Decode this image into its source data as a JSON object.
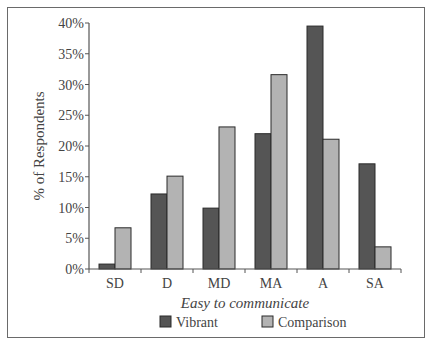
{
  "chart_data": {
    "type": "bar",
    "title": "",
    "xlabel": "Easy to communicate",
    "ylabel": "% of Respondents",
    "categories": [
      "SD",
      "D",
      "MD",
      "MA",
      "A",
      "SA"
    ],
    "series": [
      {
        "name": "Vibrant",
        "color": "#555555",
        "values": [
          0.8,
          12.2,
          9.9,
          22.0,
          39.5,
          17.1
        ]
      },
      {
        "name": "Comparison",
        "color": "#b3b3b3",
        "values": [
          6.7,
          15.1,
          23.1,
          31.6,
          21.1,
          3.6
        ]
      }
    ],
    "yticks": [
      "0%",
      "5%",
      "10%",
      "15%",
      "20%",
      "25%",
      "30%",
      "35%",
      "40%"
    ],
    "ylim": [
      0,
      40
    ],
    "grid": false,
    "legend_position": "bottom"
  }
}
